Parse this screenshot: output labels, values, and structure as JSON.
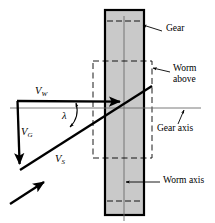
{
  "figure": {
    "width": 215,
    "height": 223,
    "background": "#ffffff",
    "ink_color": "#000000",
    "gear_fill": "#c9c9c9",
    "thin_line_color": "#6b6b6b"
  },
  "labels": {
    "gear": "Gear",
    "worm_above_line1": "Worm",
    "worm_above_line2": "above",
    "gear_axis": "Gear axis",
    "worm_axis": "Worm axis"
  },
  "vectors": {
    "worm_velocity": "V",
    "worm_velocity_sub": "W",
    "gear_velocity": "V",
    "gear_velocity_sub": "G",
    "sliding_velocity": "V",
    "sliding_velocity_sub": "S",
    "lead_angle": "λ"
  },
  "geometry": {
    "gear_rect": {
      "x": 105,
      "y": 10,
      "w": 39,
      "h": 205
    },
    "worm_dashed_rect": {
      "x": 93,
      "y": 61,
      "w": 59,
      "h": 97
    },
    "gear_axis_line": {
      "x1": 10,
      "y1": 108,
      "x2": 201,
      "y2": 108
    },
    "worm_axis_line": {
      "x1": 124,
      "y1": 16,
      "x2": 124,
      "y2": 221
    },
    "vw_arrow": {
      "x1": 17,
      "y1": 101,
      "x2": 125,
      "y2": 101
    },
    "vg_arrow": {
      "x1": 17,
      "y1": 101,
      "x2": 20,
      "y2": 170
    },
    "vs_arrow": {
      "x1": 20,
      "y1": 170,
      "x2": 152,
      "y2": 86
    },
    "free_arrow": {
      "x1": 10,
      "y1": 205,
      "x2": 45,
      "y2": 182
    },
    "lead_angle_deg": 32
  }
}
